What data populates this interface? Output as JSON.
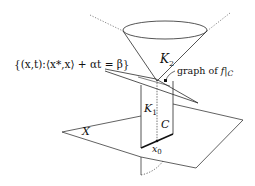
{
  "diagram": {
    "type": "geometric-3d-illustration",
    "colors": {
      "stroke": "#2a2a2a",
      "text": "#111111",
      "background": "#ffffff"
    },
    "labels": {
      "hyperplane_set": "{(x,t):⟨x*,x⟩ + αt = β}",
      "cone_upper": "K",
      "cone_upper_sub": "2",
      "cone_lower": "K",
      "cone_lower_sub": "1",
      "graph_label": "graph of f|C",
      "graph_prefix": "graph of ",
      "graph_f": "f",
      "graph_bar": "|",
      "graph_c": "C",
      "set_c": "C",
      "point": "x",
      "point_sub": "0",
      "plane": "X"
    },
    "elements": [
      "cone K2 (upward cone with elliptical top)",
      "hyperplane {(x,t): <x*,x> + alpha t = beta}",
      "rectangle K1 over segment C",
      "horizontal plane X",
      "point x0 on C",
      "graph of f restricted to C",
      "dashed vertical axis"
    ]
  }
}
